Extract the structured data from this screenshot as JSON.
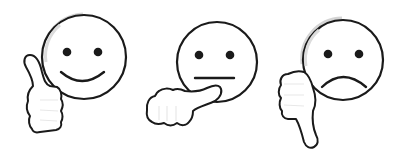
{
  "icons": [
    {
      "name": "thumbs-up-smiley",
      "sentiment": "positive",
      "gesture": "thumbs-up",
      "face": "smile"
    },
    {
      "name": "thumbs-sideways-neutral",
      "sentiment": "neutral",
      "gesture": "thumb-sideways",
      "face": "neutral"
    },
    {
      "name": "thumbs-down-frowny",
      "sentiment": "negative",
      "gesture": "thumbs-down",
      "face": "frown"
    }
  ],
  "colors": {
    "stroke": "#1a1a1a",
    "fill": "#ffffff",
    "shade": "#d8d8d8",
    "background": "#ffffff"
  }
}
